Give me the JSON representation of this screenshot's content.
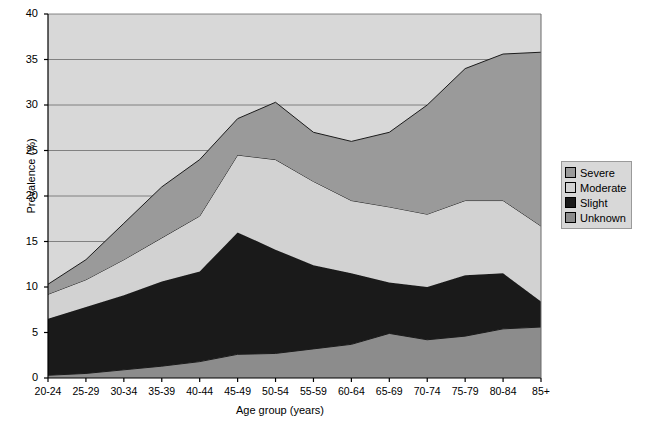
{
  "chart_data": {
    "type": "area",
    "stacked": true,
    "title": "",
    "xlabel": "Age group (years)",
    "ylabel": "Prevalence (%)",
    "categories": [
      "20-24",
      "25-29",
      "30-34",
      "35-39",
      "40-44",
      "45-49",
      "50-54",
      "55-59",
      "60-64",
      "65-69",
      "70-74",
      "75-79",
      "80-84",
      "85+"
    ],
    "ylim": [
      0,
      40
    ],
    "yticks": [
      0,
      5,
      10,
      15,
      20,
      25,
      30,
      35,
      40
    ],
    "grid": true,
    "legend_position": "right",
    "stack_order_bottom_to_top": [
      "Unknown",
      "Slight",
      "Moderate",
      "Severe"
    ],
    "series": [
      {
        "name": "Unknown",
        "color": "#8c8c8c",
        "values": [
          0.3,
          0.5,
          0.9,
          1.3,
          1.8,
          2.6,
          2.7,
          3.2,
          3.7,
          4.9,
          4.2,
          4.6,
          5.4,
          5.6
        ]
      },
      {
        "name": "Slight",
        "color": "#1a1a1a",
        "values": [
          6.2,
          7.3,
          8.2,
          9.3,
          9.9,
          13.4,
          11.4,
          9.2,
          7.8,
          5.6,
          5.8,
          6.7,
          6.1,
          2.8
        ]
      },
      {
        "name": "Moderate",
        "color": "#d2d2d2",
        "values": [
          2.7,
          3.0,
          3.9,
          4.8,
          6.1,
          8.5,
          9.9,
          9.2,
          8.0,
          8.3,
          8.0,
          8.2,
          8.0,
          8.3
        ]
      },
      {
        "name": "Severe",
        "color": "#9a9a9a",
        "values": [
          1.1,
          2.2,
          4.0,
          5.6,
          6.2,
          4.0,
          6.3,
          5.4,
          6.5,
          8.2,
          12.0,
          14.5,
          16.1,
          19.1
        ]
      }
    ],
    "stack_tops": {
      "Unknown": [
        0.3,
        0.5,
        0.9,
        1.3,
        1.8,
        2.6,
        2.7,
        3.2,
        3.7,
        4.9,
        4.2,
        4.6,
        5.4,
        5.6
      ],
      "Slight": [
        6.5,
        7.8,
        9.1,
        10.6,
        11.7,
        16.0,
        14.1,
        12.4,
        11.5,
        10.5,
        10.0,
        11.3,
        11.5,
        8.4
      ],
      "Moderate": [
        9.2,
        10.8,
        13.0,
        15.4,
        17.8,
        24.5,
        24.0,
        21.6,
        19.5,
        18.8,
        18.0,
        19.5,
        19.5,
        16.7
      ],
      "Severe": [
        10.3,
        13.0,
        17.0,
        21.0,
        24.0,
        28.5,
        30.3,
        27.0,
        26.0,
        27.0,
        30.0,
        34.0,
        35.6,
        35.8
      ]
    }
  },
  "legend": {
    "items": [
      {
        "label": "Severe"
      },
      {
        "label": "Moderate"
      },
      {
        "label": "Slight"
      },
      {
        "label": "Unknown"
      }
    ]
  },
  "colors": {
    "plot_background": "#d8d8d8",
    "grid_line": "#6b6b6b",
    "axis_line": "#000000",
    "series_outline": "#1c1c1c"
  }
}
